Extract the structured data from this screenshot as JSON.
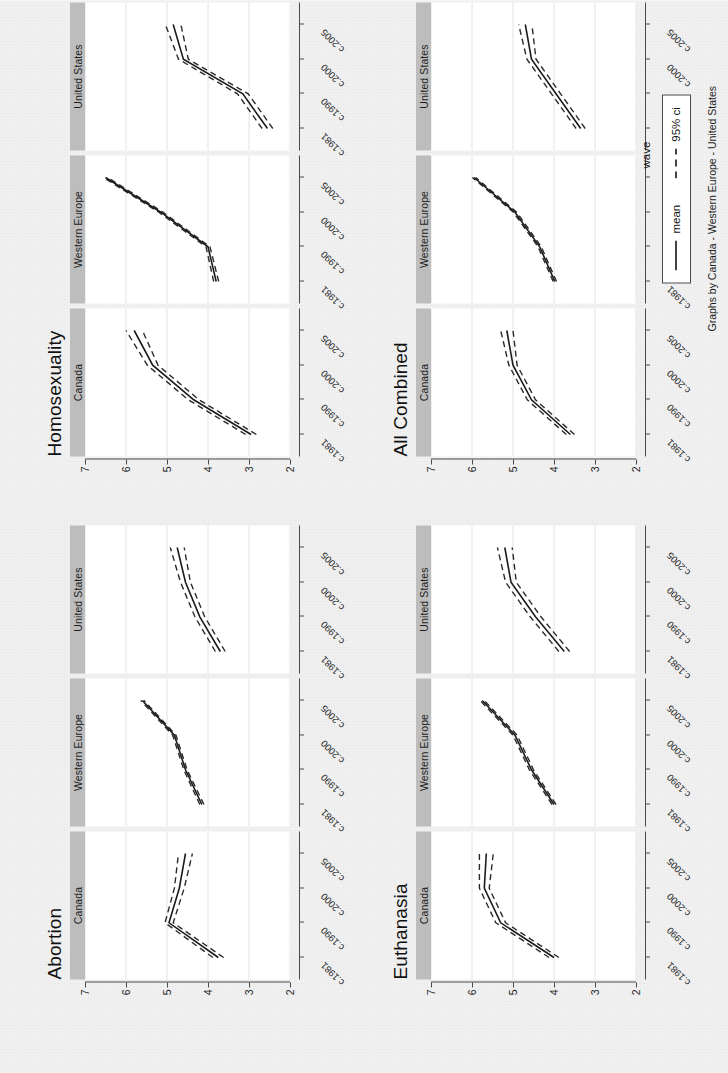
{
  "figure": {
    "xlabel": "wave",
    "caption": "Graphs by Canada - Western Europe - United States",
    "rotation_note": "page scanned rotated 90 degrees counter-clockwise"
  },
  "legend": {
    "items": [
      {
        "label": "mean",
        "style": "solid"
      },
      {
        "label": "95% ci",
        "style": "dashed"
      }
    ]
  },
  "axes": {
    "y_ticks": [
      "2",
      "3",
      "4",
      "5",
      "6",
      "7"
    ],
    "y_min": 2,
    "y_max": 7,
    "x_ticks": [
      "c.1981",
      "c.1990",
      "c.2000",
      "c.2005"
    ]
  },
  "panel_strips": [
    "Canada",
    "Western Europe",
    "United States"
  ],
  "chart_data": [
    {
      "type": "line",
      "title": "Abortion",
      "xlabel": "wave",
      "ylabel": "",
      "ylim": [
        2,
        7
      ],
      "grid": true,
      "legend": "below",
      "x": [
        "c.1981",
        "c.1990",
        "c.2000",
        "c.2005"
      ],
      "facets": [
        {
          "name": "Canada",
          "series": [
            {
              "name": "mean",
              "values": [
                3.75,
                4.95,
                4.7,
                4.55
              ]
            },
            {
              "name": "ci_lower",
              "values": [
                3.62,
                4.85,
                4.58,
                4.38
              ]
            },
            {
              "name": "ci_upper",
              "values": [
                3.88,
                5.05,
                4.82,
                4.72
              ]
            }
          ]
        },
        {
          "name": "Western Europe",
          "series": [
            {
              "name": "mean",
              "values": [
                4.15,
                4.55,
                4.82,
                5.6
              ]
            },
            {
              "name": "ci_lower",
              "values": [
                4.1,
                4.51,
                4.78,
                5.56
              ]
            },
            {
              "name": "ci_upper",
              "values": [
                4.2,
                4.59,
                4.86,
                5.64
              ]
            }
          ]
        },
        {
          "name": "United States",
          "series": [
            {
              "name": "mean",
              "values": [
                3.7,
                4.2,
                4.55,
                4.75
              ]
            },
            {
              "name": "ci_lower",
              "values": [
                3.58,
                4.08,
                4.43,
                4.58
              ]
            },
            {
              "name": "ci_upper",
              "values": [
                3.82,
                4.32,
                4.67,
                4.92
              ]
            }
          ]
        }
      ]
    },
    {
      "type": "line",
      "title": "Homosexuality",
      "xlabel": "wave",
      "ylabel": "",
      "ylim": [
        2,
        7
      ],
      "grid": true,
      "legend": "below",
      "x": [
        "c.1981",
        "c.1990",
        "c.2000",
        "c.2005"
      ],
      "facets": [
        {
          "name": "Canada",
          "series": [
            {
              "name": "mean",
              "values": [
                2.95,
                4.35,
                5.35,
                5.8
              ]
            },
            {
              "name": "ci_lower",
              "values": [
                2.82,
                4.22,
                5.22,
                5.6
              ]
            },
            {
              "name": "ci_upper",
              "values": [
                3.08,
                4.48,
                5.48,
                6.0
              ]
            }
          ]
        },
        {
          "name": "Western Europe",
          "series": [
            {
              "name": "mean",
              "values": [
                3.8,
                4.0,
                5.15,
                6.5
              ]
            },
            {
              "name": "ci_lower",
              "values": [
                3.74,
                3.95,
                5.1,
                6.45
              ]
            },
            {
              "name": "ci_upper",
              "values": [
                3.86,
                4.05,
                5.2,
                6.55
              ]
            }
          ]
        },
        {
          "name": "United States",
          "series": [
            {
              "name": "mean",
              "values": [
                2.55,
                3.15,
                4.6,
                4.85
              ]
            },
            {
              "name": "ci_lower",
              "values": [
                2.42,
                3.02,
                4.48,
                4.66
              ]
            },
            {
              "name": "ci_upper",
              "values": [
                2.68,
                3.28,
                4.72,
                5.04
              ]
            }
          ]
        }
      ]
    },
    {
      "type": "line",
      "title": "Euthanasia",
      "xlabel": "wave",
      "ylabel": "",
      "ylim": [
        2,
        7
      ],
      "grid": true,
      "legend": "below",
      "x": [
        "c.1981",
        "c.1990",
        "c.2000",
        "c.2005"
      ],
      "facets": [
        {
          "name": "Canada",
          "series": [
            {
              "name": "mean",
              "values": [
                4.0,
                5.3,
                5.7,
                5.65
              ]
            },
            {
              "name": "ci_lower",
              "values": [
                3.88,
                5.18,
                5.58,
                5.48
              ]
            },
            {
              "name": "ci_upper",
              "values": [
                4.12,
                5.42,
                5.82,
                5.82
              ]
            }
          ]
        },
        {
          "name": "Western Europe",
          "series": [
            {
              "name": "mean",
              "values": [
                4.0,
                4.55,
                4.95,
                5.75
              ]
            },
            {
              "name": "ci_lower",
              "values": [
                3.95,
                4.5,
                4.9,
                5.7
              ]
            },
            {
              "name": "ci_upper",
              "values": [
                4.05,
                4.6,
                5.0,
                5.8
              ]
            }
          ]
        },
        {
          "name": "United States",
          "series": [
            {
              "name": "mean",
              "values": [
                3.75,
                4.45,
                5.05,
                5.2
              ]
            },
            {
              "name": "ci_lower",
              "values": [
                3.62,
                4.32,
                4.92,
                5.02
              ]
            },
            {
              "name": "ci_upper",
              "values": [
                3.88,
                4.58,
                5.18,
                5.38
              ]
            }
          ]
        }
      ]
    },
    {
      "type": "line",
      "title": "All Combined",
      "xlabel": "wave",
      "ylabel": "",
      "ylim": [
        2,
        7
      ],
      "grid": true,
      "legend": "below",
      "x": [
        "c.1981",
        "c.1990",
        "c.2000",
        "c.2005"
      ],
      "facets": [
        {
          "name": "Canada",
          "series": [
            {
              "name": "mean",
              "values": [
                3.6,
                4.55,
                5.0,
                5.15
              ]
            },
            {
              "name": "ci_lower",
              "values": [
                3.5,
                4.45,
                4.9,
                5.0
              ]
            },
            {
              "name": "ci_upper",
              "values": [
                3.7,
                4.65,
                5.1,
                5.3
              ]
            }
          ]
        },
        {
          "name": "Western Europe",
          "series": [
            {
              "name": "mean",
              "values": [
                3.98,
                4.35,
                4.95,
                5.95
              ]
            },
            {
              "name": "ci_lower",
              "values": [
                3.94,
                4.31,
                4.91,
                5.91
              ]
            },
            {
              "name": "ci_upper",
              "values": [
                4.02,
                4.39,
                4.99,
                5.99
              ]
            }
          ]
        },
        {
          "name": "United States",
          "series": [
            {
              "name": "mean",
              "values": [
                3.35,
                3.95,
                4.55,
                4.7
              ]
            },
            {
              "name": "ci_lower",
              "values": [
                3.24,
                3.84,
                4.44,
                4.54
              ]
            },
            {
              "name": "ci_upper",
              "values": [
                3.46,
                4.06,
                4.66,
                4.86
              ]
            }
          ]
        }
      ]
    }
  ]
}
